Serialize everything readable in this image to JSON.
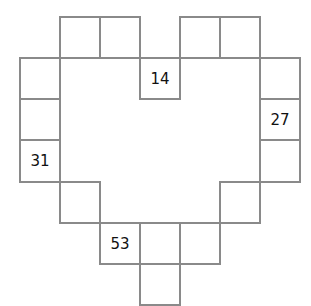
{
  "grid": {
    "cells": [
      {
        "row": 0,
        "col": 1,
        "value": ""
      },
      {
        "row": 0,
        "col": 2,
        "value": ""
      },
      {
        "row": 0,
        "col": 4,
        "value": ""
      },
      {
        "row": 0,
        "col": 5,
        "value": ""
      },
      {
        "row": 1,
        "col": 0,
        "value": ""
      },
      {
        "row": 1,
        "col": 3,
        "value": "14"
      },
      {
        "row": 1,
        "col": 6,
        "value": ""
      },
      {
        "row": 2,
        "col": 0,
        "value": ""
      },
      {
        "row": 2,
        "col": 6,
        "value": "27"
      },
      {
        "row": 3,
        "col": 0,
        "value": "31"
      },
      {
        "row": 3,
        "col": 6,
        "value": ""
      },
      {
        "row": 4,
        "col": 1,
        "value": ""
      },
      {
        "row": 4,
        "col": 5,
        "value": ""
      },
      {
        "row": 5,
        "col": 2,
        "value": "53"
      },
      {
        "row": 5,
        "col": 3,
        "value": ""
      },
      {
        "row": 5,
        "col": 4,
        "value": ""
      },
      {
        "row": 6,
        "col": 3,
        "value": ""
      }
    ]
  }
}
